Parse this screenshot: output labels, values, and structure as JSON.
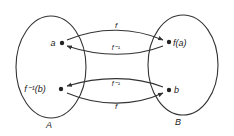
{
  "diagram": {
    "sets": [
      {
        "name": "A",
        "label": "A"
      },
      {
        "name": "B",
        "label": "B"
      }
    ],
    "points": {
      "a": "a",
      "fa": "f(a)",
      "finvb": "f⁻¹(b)",
      "b": "b"
    },
    "arrows": {
      "top_forward": "f",
      "top_inverse": "f⁻¹",
      "bottom_inverse": "f⁻¹",
      "bottom_forward": "f"
    },
    "colors": {
      "stroke": "#333333",
      "background": "#ffffff"
    }
  }
}
